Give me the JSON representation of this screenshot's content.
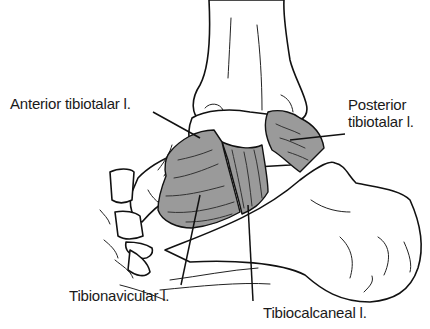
{
  "figure": {
    "ligament_fill_color": "#9a9a9a",
    "line_color": "#111111"
  },
  "labels": {
    "anterior_tibiotalar": "Anterior tibiotalar l.",
    "posterior_tibiotalar_line1": "Posterior",
    "posterior_tibiotalar_line2": "tibiotalar l.",
    "tibionavicular": "Tibionavicular l.",
    "tibiocalcaneal": "Tibiocalcaneal l."
  }
}
